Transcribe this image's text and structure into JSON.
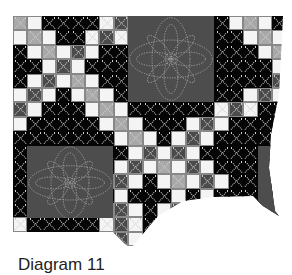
{
  "figure": {
    "caption": "Diagram 11",
    "colors": {
      "light": "#f4f4f4",
      "black": "#050505",
      "mid_gray": "#a8a8a8",
      "dark_gray": "#4a4a4a",
      "block_fill": "#4d4d4d",
      "quilting_line": "#cfcfcf"
    },
    "grid": {
      "columns": 19,
      "rows": 16,
      "legend": {
        "W": "light square",
        "B": "black square",
        "G": "mid-gray square",
        "D": "dark-gray square"
      },
      "cells": [
        "GWBBBBWDWBBBBBBWGWB",
        "WGWBBWDWBBBBBBBBWGW",
        "BWGWDWBBBBBBBBBBBWG",
        "BBWDWBBBBBBBBBBBBBW",
        "BWDWGWBBBBBBBBBBBBD",
        "WDWBWGWBBBBBBBBBWDW",
        "DWBBBWGWBBBBBBWDWBB",
        "WBBBBBWGWBBBWDWBBBB",
        "BBBBBBBWGWBWDWBBBBB",
        "BBBBBBBBWDWDWBBBBBB",
        "BBBBBBBWDWGWDWBBBBB",
        "BBBBBBWDWBWGWDWBBBB",
        "BBBBBBBWBBBWBWBBBBB",
        "BBBBBBWDWBWDWBWDBBB",
        "WBBBBBWDWBBWBBBBBBB",
        "GWBBBBWDWBBBBBBBBBB"
      ]
    },
    "flower_blocks": [
      {
        "name": "top-right",
        "col": 8,
        "row": 0,
        "span": 6
      },
      {
        "name": "bottom-left",
        "col": 1,
        "row": 9,
        "span": 6
      },
      {
        "name": "right-edge-partial",
        "col": 17,
        "row": 9,
        "span": 2
      }
    ]
  }
}
